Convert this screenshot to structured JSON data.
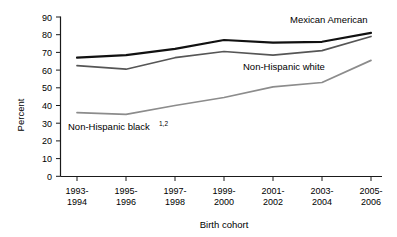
{
  "chart_data": {
    "type": "line",
    "title": "",
    "xlabel": "Birth cohort",
    "ylabel": "Percent",
    "ylim": [
      0,
      90
    ],
    "ytick_step": 10,
    "grid": false,
    "legend_position": "inline-annotations",
    "categories": [
      "1993-\n1994",
      "1995-\n1996",
      "1997-\n1998",
      "1999-\n2000",
      "2001-\n2002",
      "2003-\n2004",
      "2005-\n2006"
    ],
    "categories_line1": [
      "1993-",
      "1995-",
      "1997-",
      "1999-",
      "2001-",
      "2003-",
      "2005-"
    ],
    "categories_line2": [
      "1994",
      "1996",
      "1998",
      "2000",
      "2002",
      "2004",
      "2006"
    ],
    "yticks": [
      "0",
      "10",
      "20",
      "30",
      "40",
      "50",
      "60",
      "70",
      "80",
      "90"
    ],
    "series": [
      {
        "name": "Mexican American",
        "label": "Mexican American",
        "footnote": "",
        "color": "#111111",
        "width": 2.2,
        "values": [
          67,
          68.5,
          72,
          77,
          75.5,
          76,
          81
        ]
      },
      {
        "name": "Non-Hispanic white",
        "label": "Non-Hispanic white",
        "footnote": "",
        "color": "#565656",
        "width": 1.7,
        "values": [
          62.5,
          60.5,
          67,
          70.5,
          68.5,
          71,
          79
        ]
      },
      {
        "name": "Non-Hispanic black",
        "label": "Non-Hispanic black",
        "footnote": "1,2",
        "color": "#8c8c8c",
        "width": 1.7,
        "values": [
          36,
          35,
          40,
          44.5,
          50.5,
          53,
          65.5
        ]
      }
    ],
    "annotations": [
      {
        "text": "Mexican American",
        "series": "Mexican American"
      },
      {
        "text": "Non-Hispanic white",
        "series": "Non-Hispanic white"
      },
      {
        "text": "Non-Hispanic black",
        "sup": "1,2",
        "series": "Non-Hispanic black"
      }
    ]
  },
  "axis": {
    "y_title": "Percent",
    "x_title": "Birth cohort"
  }
}
